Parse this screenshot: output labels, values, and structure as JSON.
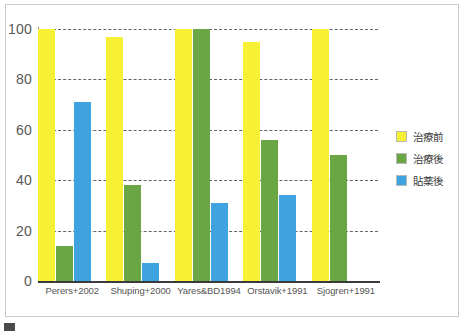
{
  "chart_data": {
    "type": "bar",
    "title": "",
    "subtitle": "",
    "xlabel": "",
    "ylabel": "",
    "ylim": [
      0,
      100
    ],
    "yticks": [
      "0",
      "20",
      "40",
      "60",
      "80",
      "100"
    ],
    "grid": true,
    "legend_position": "right",
    "categories": [
      "Perers+2002",
      "Shuping+2000",
      "Yares&BD1994",
      "Orstavik+1991",
      "Sjogren+1991"
    ],
    "series": [
      {
        "name": "治療前",
        "color": "#f7f135",
        "values": [
          100,
          97,
          100,
          95,
          100
        ]
      },
      {
        "name": "治療後",
        "color": "#6ba644",
        "values": [
          14,
          38,
          100,
          56,
          50
        ]
      },
      {
        "name": "貼薬後",
        "color": "#3fa3e0",
        "values": [
          71,
          7,
          31,
          34,
          null
        ]
      }
    ]
  },
  "legend": {
    "items": [
      {
        "label": "治療前",
        "color": "#f7f135"
      },
      {
        "label": "治療後",
        "color": "#6ba644"
      },
      {
        "label": "貼薬後",
        "color": "#3fa3e0"
      }
    ]
  },
  "caption": {
    "marker": "",
    "text": ""
  }
}
